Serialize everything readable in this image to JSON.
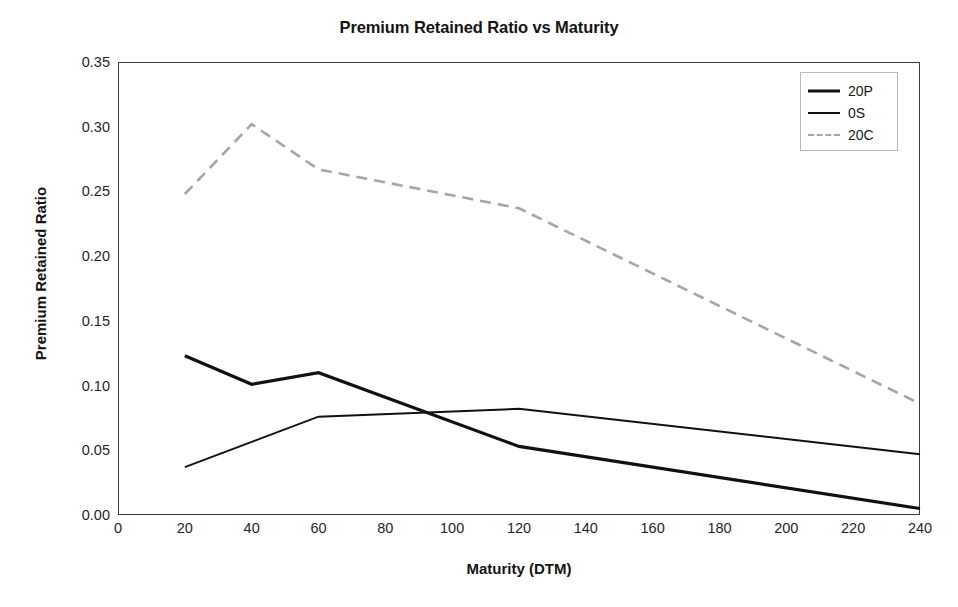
{
  "chart_data": {
    "type": "line",
    "title": "Premium Retained Ratio vs Maturity",
    "xlabel": "Maturity (DTM)",
    "ylabel": "Premium Retained Ratio",
    "xlim": [
      0,
      240
    ],
    "ylim": [
      0,
      0.35
    ],
    "x_ticks": [
      0,
      20,
      40,
      60,
      80,
      100,
      120,
      140,
      160,
      180,
      200,
      220,
      240
    ],
    "y_ticks": [
      0.0,
      0.05,
      0.1,
      0.15,
      0.2,
      0.25,
      0.3,
      0.35
    ],
    "x_tick_labels": [
      "0",
      "20",
      "40",
      "60",
      "80",
      "100",
      "120",
      "140",
      "160",
      "180",
      "200",
      "220",
      "240"
    ],
    "y_tick_labels": [
      "0.00",
      "0.05",
      "0.10",
      "0.15",
      "0.20",
      "0.25",
      "0.30",
      "0.35"
    ],
    "grid": false,
    "legend_position": "top-right",
    "series": [
      {
        "name": "20P",
        "color": "#111111",
        "style": "solid",
        "width": 3.2,
        "x": [
          20,
          40,
          60,
          120,
          240
        ],
        "values": [
          0.123,
          0.101,
          0.11,
          0.053,
          0.005
        ]
      },
      {
        "name": "0S",
        "color": "#111111",
        "style": "solid",
        "width": 2.0,
        "x": [
          20,
          60,
          120,
          240
        ],
        "values": [
          0.037,
          0.076,
          0.082,
          0.047
        ]
      },
      {
        "name": "20C",
        "color": "#a6a6a6",
        "style": "dashed",
        "width": 2.6,
        "x": [
          20,
          40,
          60,
          120,
          240
        ],
        "values": [
          0.248,
          0.302,
          0.267,
          0.237,
          0.086
        ]
      }
    ]
  },
  "legend": {
    "items": [
      {
        "label": "20P"
      },
      {
        "label": "0S"
      },
      {
        "label": "20C"
      }
    ]
  },
  "colors": {
    "frame": "#3b3b3b",
    "text": "#141414",
    "series_dark": "#111111",
    "series_gray": "#a6a6a6",
    "background": "#ffffff"
  }
}
